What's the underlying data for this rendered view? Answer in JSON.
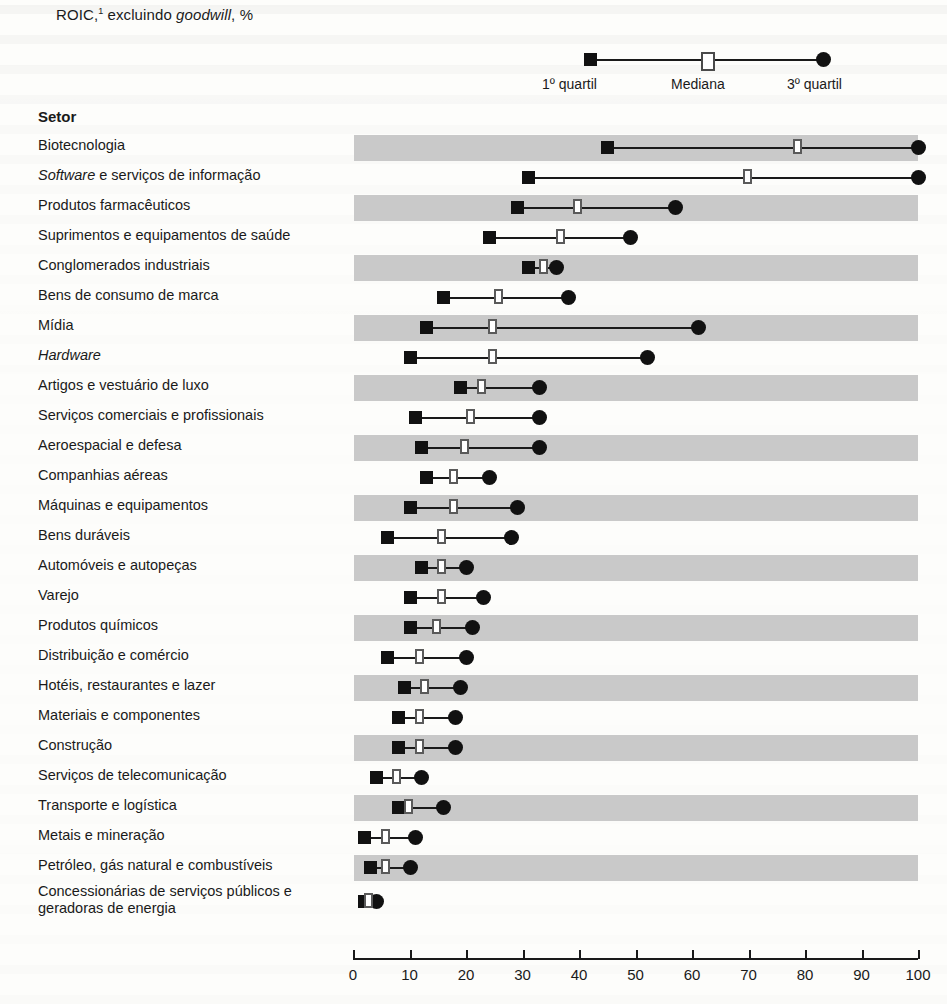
{
  "title": {
    "prefix": "ROIC,",
    "footnote_marker": "1",
    "mid": " excluindo ",
    "italic": "goodwill",
    "suffix": ", %"
  },
  "legend": {
    "q1_label": "1º quartil",
    "median_label": "Mediana",
    "q3_label": "3º quartil",
    "q1_icon": "filled-square-icon",
    "median_icon": "open-square-icon",
    "q3_icon": "filled-circle-icon"
  },
  "table": {
    "column_header": "Setor"
  },
  "chart_data": {
    "type": "bar",
    "subtype": "quartile-range-dot-plot",
    "xlabel": "",
    "ylabel": "Setor",
    "xlim": [
      0,
      100
    ],
    "xticks": [
      0,
      10,
      20,
      30,
      40,
      50,
      60,
      70,
      80,
      90,
      100
    ],
    "xtick_labels": [
      "0",
      "10",
      "20",
      "30",
      "40",
      "50",
      "60",
      "70",
      "80",
      "90",
      "100"
    ],
    "grid": false,
    "legend_position": "top-right",
    "series": [
      {
        "name": "1º quartil",
        "marker": "filled-square"
      },
      {
        "name": "Mediana",
        "marker": "open-square"
      },
      {
        "name": "3º quartil",
        "marker": "filled-circle"
      }
    ],
    "categories": [
      "Biotecnologia",
      "Software e serviços de informação",
      "Produtos farmacêuticos",
      "Suprimentos e equipamentos de saúde",
      "Conglomerados industriais",
      "Bens de consumo de marca",
      "Mídia",
      "Hardware",
      "Artigos e vestuário de luxo",
      "Serviços comerciais e profissionais",
      "Aeroespacial e defesa",
      "Companhias aéreas",
      "Máquinas e equipamentos",
      "Bens duráveis",
      "Automóveis e autopeças",
      "Varejo",
      "Produtos químicos",
      "Distribuição e comércio",
      "Hotéis, restaurantes e lazer",
      "Materiais e componentes",
      "Construção",
      "Serviços de telecomunicação",
      "Transporte e logística",
      "Metais e mineração",
      "Petróleo, gás natural e combustíveis",
      "Concessionárias de serviços públicos e geradoras de energia"
    ],
    "rows": [
      {
        "label": "Biotecnologia",
        "italic_prefix": "",
        "q1": 45,
        "median": 79,
        "q3": 100,
        "band": true,
        "tall": false
      },
      {
        "label": " e serviços de informação",
        "italic_prefix": "Software",
        "q1": 31,
        "median": 70,
        "q3": 100,
        "band": false,
        "tall": false
      },
      {
        "label": "Produtos farmacêuticos",
        "italic_prefix": "",
        "q1": 29,
        "median": 40,
        "q3": 57,
        "band": true,
        "tall": false
      },
      {
        "label": "Suprimentos e equipamentos de saúde",
        "italic_prefix": "",
        "q1": 24,
        "median": 37,
        "q3": 49,
        "band": false,
        "tall": false
      },
      {
        "label": "Conglomerados industriais",
        "italic_prefix": "",
        "q1": 31,
        "median": 34,
        "q3": 36,
        "band": true,
        "tall": false
      },
      {
        "label": "Bens de consumo de marca",
        "italic_prefix": "",
        "q1": 16,
        "median": 26,
        "q3": 38,
        "band": false,
        "tall": false
      },
      {
        "label": "Mídia",
        "italic_prefix": "",
        "q1": 13,
        "median": 25,
        "q3": 61,
        "band": true,
        "tall": false
      },
      {
        "label": "",
        "italic_prefix": "Hardware",
        "q1": 10,
        "median": 25,
        "q3": 52,
        "band": false,
        "tall": false
      },
      {
        "label": "Artigos e vestuário de luxo",
        "italic_prefix": "",
        "q1": 19,
        "median": 23,
        "q3": 33,
        "band": true,
        "tall": false
      },
      {
        "label": "Serviços comerciais e profissionais",
        "italic_prefix": "",
        "q1": 11,
        "median": 21,
        "q3": 33,
        "band": false,
        "tall": false
      },
      {
        "label": "Aeroespacial e defesa",
        "italic_prefix": "",
        "q1": 12,
        "median": 20,
        "q3": 33,
        "band": true,
        "tall": false
      },
      {
        "label": "Companhias aéreas",
        "italic_prefix": "",
        "q1": 13,
        "median": 18,
        "q3": 24,
        "band": false,
        "tall": false
      },
      {
        "label": "Máquinas e equipamentos",
        "italic_prefix": "",
        "q1": 10,
        "median": 18,
        "q3": 29,
        "band": true,
        "tall": false
      },
      {
        "label": "Bens duráveis",
        "italic_prefix": "",
        "q1": 6,
        "median": 16,
        "q3": 28,
        "band": false,
        "tall": false
      },
      {
        "label": "Automóveis e autopeças",
        "italic_prefix": "",
        "q1": 12,
        "median": 16,
        "q3": 20,
        "band": true,
        "tall": false
      },
      {
        "label": "Varejo",
        "italic_prefix": "",
        "q1": 10,
        "median": 16,
        "q3": 23,
        "band": false,
        "tall": false
      },
      {
        "label": "Produtos químicos",
        "italic_prefix": "",
        "q1": 10,
        "median": 15,
        "q3": 21,
        "band": true,
        "tall": false
      },
      {
        "label": "Distribuição e comércio",
        "italic_prefix": "",
        "q1": 6,
        "median": 12,
        "q3": 20,
        "band": false,
        "tall": false
      },
      {
        "label": "Hotéis, restaurantes e lazer",
        "italic_prefix": "",
        "q1": 9,
        "median": 13,
        "q3": 19,
        "band": true,
        "tall": false
      },
      {
        "label": "Materiais e componentes",
        "italic_prefix": "",
        "q1": 8,
        "median": 12,
        "q3": 18,
        "band": false,
        "tall": false
      },
      {
        "label": "Construção",
        "italic_prefix": "",
        "q1": 8,
        "median": 12,
        "q3": 18,
        "band": true,
        "tall": false
      },
      {
        "label": "Serviços de telecomunicação",
        "italic_prefix": "",
        "q1": 4,
        "median": 8,
        "q3": 12,
        "band": false,
        "tall": false
      },
      {
        "label": "Transporte e logística",
        "italic_prefix": "",
        "q1": 8,
        "median": 10,
        "q3": 16,
        "band": true,
        "tall": false
      },
      {
        "label": "Metais e mineração",
        "italic_prefix": "",
        "q1": 2,
        "median": 6,
        "q3": 11,
        "band": false,
        "tall": false
      },
      {
        "label": "Petróleo, gás natural e combustíveis",
        "italic_prefix": "",
        "q1": 3,
        "median": 6,
        "q3": 10,
        "band": true,
        "tall": false
      },
      {
        "label": "Concessionárias de serviços públicos e geradoras de energia",
        "italic_prefix": "",
        "q1": 2,
        "median": 3,
        "q3": 4,
        "band": false,
        "tall": true
      }
    ]
  },
  "colors": {
    "marker_fill": "#111111",
    "median_outline": "#5a5a5a",
    "band": "#c9c9c9",
    "text": "#1a1a1a"
  }
}
